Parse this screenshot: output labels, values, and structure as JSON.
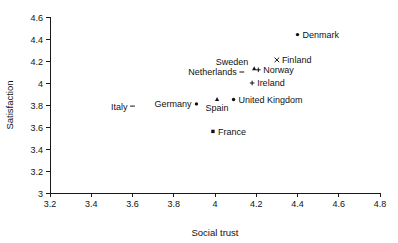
{
  "chart_data": {
    "type": "scatter",
    "title": "",
    "xlabel": "Social trust",
    "ylabel": "Satisfaction",
    "xlim": [
      3.2,
      4.8
    ],
    "ylim": [
      3.0,
      4.6
    ],
    "xticks": [
      "3.2",
      "3.4",
      "3.6",
      "3.8",
      "4",
      "4.2",
      "4.4",
      "4.6",
      "4.8"
    ],
    "yticks": [
      "3",
      "3.2",
      "3.4",
      "3.6",
      "3.8",
      "4",
      "4.2",
      "4.4",
      "4.6"
    ],
    "grid": false,
    "legend": "none",
    "points": [
      {
        "label": "Denmark",
        "x": 4.4,
        "y": 4.44,
        "marker": "dot",
        "label_pos": "right"
      },
      {
        "label": "Finland",
        "x": 4.3,
        "y": 4.21,
        "marker": "cross",
        "label_pos": "right"
      },
      {
        "label": "Sweden",
        "x": 4.19,
        "y": 4.13,
        "marker": "tri",
        "label_pos": "left-up"
      },
      {
        "label": "Norway",
        "x": 4.21,
        "y": 4.12,
        "marker": "plus",
        "label_pos": "right"
      },
      {
        "label": "Netherlands",
        "x": 4.13,
        "y": 4.1,
        "marker": "dash",
        "label_pos": "left"
      },
      {
        "label": "Ireland",
        "x": 4.18,
        "y": 4.0,
        "marker": "plus",
        "label_pos": "right"
      },
      {
        "label": "United Kingdom",
        "x": 4.09,
        "y": 3.85,
        "marker": "dot",
        "label_pos": "right"
      },
      {
        "label": "Spain",
        "x": 4.01,
        "y": 3.85,
        "marker": "tri",
        "label_pos": "below"
      },
      {
        "label": "Germany",
        "x": 3.91,
        "y": 3.81,
        "marker": "dot",
        "label_pos": "left"
      },
      {
        "label": "Italy",
        "x": 3.6,
        "y": 3.79,
        "marker": "dash",
        "label_pos": "left"
      },
      {
        "label": "France",
        "x": 3.99,
        "y": 3.56,
        "marker": "square",
        "label_pos": "right"
      }
    ]
  },
  "axes": {
    "x_title": "Social trust",
    "y_title": "Satisfaction"
  }
}
